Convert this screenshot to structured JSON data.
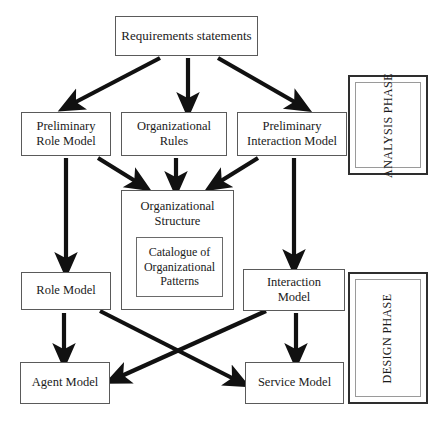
{
  "diagram": {
    "type": "flowchart",
    "line_color": "#111111",
    "box_border_color": "#5a5a5a",
    "background": "#ffffff",
    "nodes": {
      "requirements": "Requirements statements",
      "preliminary_role_model": "Preliminary\nRole Model",
      "preliminary_role_model_line1": "Preliminary",
      "preliminary_role_model_line2": "Role Model",
      "organizational_rules_line1": "Organizational",
      "organizational_rules_line2": "Rules",
      "preliminary_interaction_model_line1": "Preliminary",
      "preliminary_interaction_model_line2": "Interaction Model",
      "organizational_structure_line1": "Organizational",
      "organizational_structure_line2": "Structure",
      "catalogue_line1": "Catalogue of",
      "catalogue_line2": "Organizational",
      "catalogue_line3": "Patterns",
      "role_model": "Role Model",
      "interaction_model_line1": "Interaction",
      "interaction_model_line2": "Model",
      "agent_model": "Agent  Model",
      "service_model": "Service Model"
    },
    "phases": {
      "analysis": "ANALYSIS PHASE",
      "design": "DESIGN PHASE"
    },
    "edges": [
      {
        "from": "requirements",
        "to": "preliminary_role_model"
      },
      {
        "from": "requirements",
        "to": "organizational_rules"
      },
      {
        "from": "requirements",
        "to": "preliminary_interaction_model"
      },
      {
        "from": "preliminary_role_model",
        "to": "role_model"
      },
      {
        "from": "preliminary_role_model",
        "to": "organizational_structure"
      },
      {
        "from": "organizational_rules",
        "to": "organizational_structure"
      },
      {
        "from": "preliminary_interaction_model",
        "to": "organizational_structure"
      },
      {
        "from": "preliminary_interaction_model",
        "to": "interaction_model"
      },
      {
        "from": "role_model",
        "to": "agent_model"
      },
      {
        "from": "role_model",
        "to": "service_model"
      },
      {
        "from": "interaction_model",
        "to": "agent_model"
      },
      {
        "from": "interaction_model",
        "to": "service_model"
      }
    ]
  }
}
